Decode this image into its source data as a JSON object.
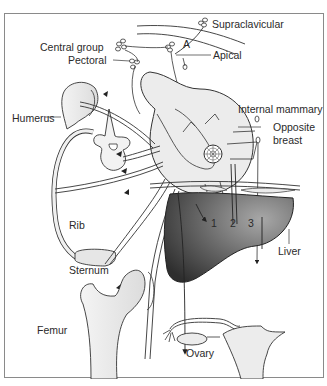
{
  "figure": {
    "labels": {
      "supraclavicular": "Supraclavicular",
      "central_group": "Central group",
      "a_marker": "A",
      "apical": "Apical",
      "pectoral": "Pectoral",
      "humerus": "Humerus",
      "internal_mammary": "Internal mammary",
      "opposite_breast_line1": "Opposite",
      "opposite_breast_line2": "breast",
      "rib": "Rib",
      "sternum": "Sternum",
      "liver": "Liver",
      "femur": "Femur",
      "ovary": "Ovary",
      "route_1": "1",
      "route_2": "2",
      "route_3": "3"
    },
    "colors": {
      "border": "#8a8a8a",
      "line": "#333333",
      "tissue_fill": "#ececec",
      "liver_dark": "#3c3c3c",
      "liver_light": "#9a9a9a"
    }
  }
}
